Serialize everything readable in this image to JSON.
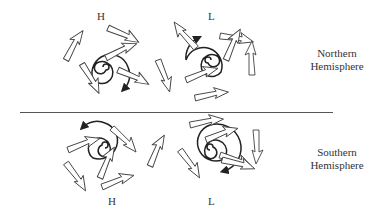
{
  "figure": {
    "type": "diagram",
    "rows": [
      {
        "hemisphere_label": "Northern\nHemisphere",
        "hemisphere_line1": "Northern",
        "hemisphere_line2": "Hemisphere",
        "systems": [
          {
            "pressure": "H",
            "rotation": "clockwise",
            "flow": "outward"
          },
          {
            "pressure": "L",
            "rotation": "counterclockwise",
            "flow": "inward"
          }
        ]
      },
      {
        "hemisphere_label": "Southern\nHemisphere",
        "hemisphere_line1": "Southern",
        "hemisphere_line2": "Hemisphere",
        "systems": [
          {
            "pressure": "H",
            "rotation": "counterclockwise",
            "flow": "outward"
          },
          {
            "pressure": "L",
            "rotation": "clockwise",
            "flow": "inward"
          }
        ]
      }
    ]
  },
  "colors": {
    "stroke": "#333333",
    "arrow_fill": "#ffffff",
    "divider": "#555555"
  }
}
